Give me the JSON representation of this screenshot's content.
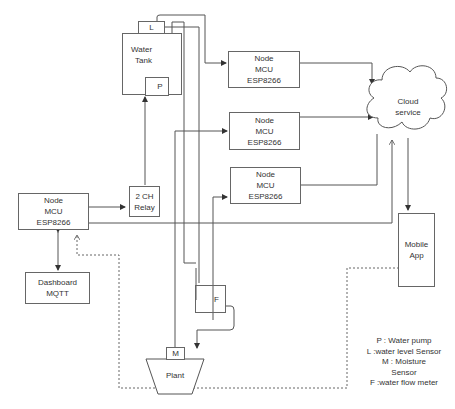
{
  "diagram": {
    "type": "system-architecture",
    "colors": {
      "line": "#555555",
      "box_border": "#666666",
      "text": "#333333",
      "background": "#ffffff"
    },
    "water_tank": {
      "line1": "Water",
      "line2": "Tank"
    },
    "sensor_L": "L",
    "pump_P": "P",
    "node_top": {
      "line1": "Node",
      "line2": "MCU",
      "line3": "ESP8266"
    },
    "node_mid": {
      "line1": "Node",
      "line2": "MCU",
      "line3": "ESP8266"
    },
    "node_low": {
      "line1": "Node",
      "line2": "MCU",
      "line3": "ESP8266"
    },
    "node_main": {
      "line1": "Node",
      "line2": "MCU",
      "line3": "ESP8266"
    },
    "relay": {
      "line1": "2 CH",
      "line2": "Relay"
    },
    "dashboard": {
      "line1": "Dashboard",
      "line2": "MQTT"
    },
    "cloud": {
      "line1": "Cloud",
      "line2": "service"
    },
    "mobile_app": {
      "line1": "Mobile",
      "line2": "App"
    },
    "flow_F": "F",
    "moisture_M": "M",
    "plant": "Plant",
    "legend": [
      "P : Water pump",
      "L :water level Sensor",
      "M : Moisture",
      "Sensor",
      "F :water flow meter"
    ],
    "connections": [
      {
        "from": "L",
        "to": "node_top",
        "style": "solid"
      },
      {
        "from": "node_top",
        "to": "cloud",
        "style": "solid"
      },
      {
        "from": "M",
        "to": "node_mid",
        "style": "solid"
      },
      {
        "from": "node_mid",
        "to": "cloud",
        "style": "solid"
      },
      {
        "from": "F",
        "to": "node_low",
        "style": "solid"
      },
      {
        "from": "node_low",
        "to": "cloud",
        "style": "solid"
      },
      {
        "from": "node_main",
        "to": "relay",
        "style": "solid"
      },
      {
        "from": "relay",
        "to": "pump_P",
        "style": "solid"
      },
      {
        "from": "node_main",
        "to": "cloud",
        "style": "solid"
      },
      {
        "from": "node_main",
        "to": "dashboard",
        "style": "bidirectional"
      },
      {
        "from": "cloud",
        "to": "mobile_app",
        "style": "solid"
      },
      {
        "from": "mobile_app",
        "to": "node_main",
        "style": "dotted"
      },
      {
        "from": "pump_P",
        "to": "F",
        "style": "pipe"
      },
      {
        "from": "F",
        "to": "plant",
        "style": "pipe"
      }
    ]
  }
}
